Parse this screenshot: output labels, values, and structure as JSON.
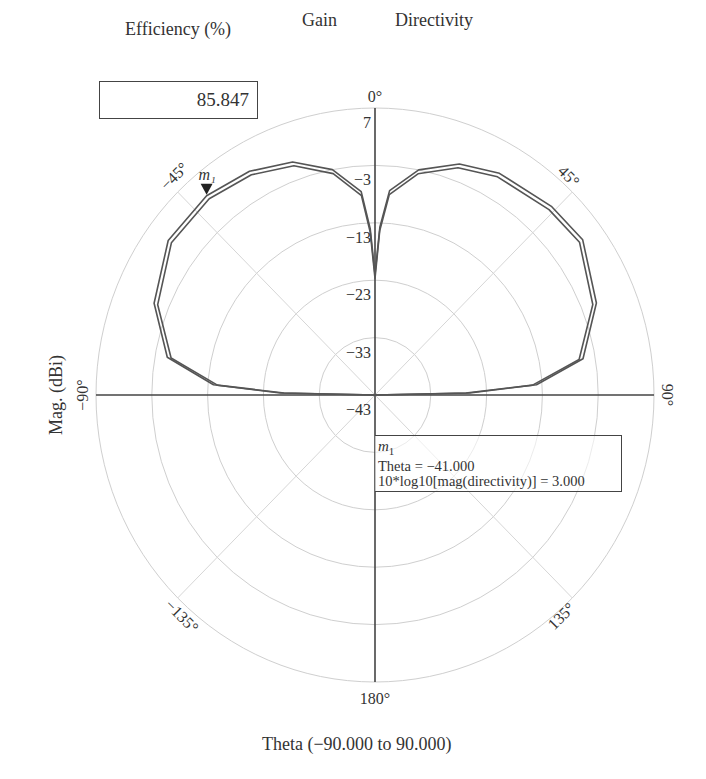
{
  "header": {
    "efficiency_label": "Efficiency (%)",
    "efficiency_value": "85.847",
    "gain_label": "Gain",
    "directivity_label": "Directivity"
  },
  "axes": {
    "ylabel": "Mag. (dBi)",
    "xlabel": "Theta (−90.000 to 90.000)",
    "radial_ticks": [
      "7",
      "−3",
      "−13",
      "−23",
      "−33",
      "−43"
    ],
    "angle_ticks": [
      "0°",
      "45°",
      "90°",
      "135°",
      "180°",
      "−135°",
      "−90°",
      "−45°"
    ]
  },
  "marker": {
    "name": "m",
    "index": "1",
    "line1": "Theta = −41.000",
    "line2": "10*log10[mag(directivity)] = 3.000"
  },
  "colors": {
    "curve": "#555555",
    "grid": "#cfcfcf",
    "axis": "#444444"
  },
  "chart_data": {
    "type": "polar-line",
    "title": "",
    "xlabel": "Theta (−90.000 to 90.000)",
    "ylabel": "Mag. (dBi)",
    "rlim": [
      -43,
      7
    ],
    "r_ticks": [
      7,
      -3,
      -13,
      -23,
      -33,
      -43
    ],
    "theta_ticks_deg": [
      0,
      45,
      90,
      135,
      180,
      -135,
      -90,
      -45
    ],
    "grid": true,
    "legend": [
      "Gain",
      "Directivity"
    ],
    "series": [
      {
        "name": "Directivity",
        "theta_deg": [
          -90,
          -88.8,
          -86.5,
          -80,
          -68,
          -54,
          -41,
          -30,
          -20,
          -11,
          -4,
          -1.7,
          0,
          1.7,
          4.2,
          11.3,
          20.6,
          30,
          44,
          54,
          68,
          80.4,
          86.5,
          88.8,
          90
        ],
        "values_dBi": [
          -43,
          -26,
          -14,
          -5.2,
          -0.3,
          2.8,
          3.0,
          2.0,
          0.2,
          -3,
          -7.5,
          -14,
          -22,
          -13.7,
          -7.3,
          -3,
          0,
          1.6,
          2.6,
          3.0,
          -0.2,
          -5.2,
          -14,
          -26,
          -43
        ]
      },
      {
        "name": "Gain",
        "theta_deg": [
          -90,
          -88.8,
          -86.5,
          -80,
          -68,
          -54,
          -41,
          -30,
          -20,
          -11,
          -4,
          -1.7,
          0,
          1.7,
          4.2,
          11.3,
          20.6,
          30,
          44,
          54,
          68,
          80.4,
          86.5,
          88.8,
          90
        ],
        "values_dBi": [
          -43,
          -26.7,
          -14.7,
          -5.9,
          -1.0,
          2.1,
          2.3,
          1.3,
          -0.5,
          -3.7,
          -8.2,
          -14.7,
          -22.7,
          -14.4,
          -8.0,
          -3.7,
          -0.7,
          0.9,
          1.9,
          2.3,
          -0.9,
          -5.9,
          -14.7,
          -26.7,
          -43
        ]
      }
    ],
    "annotations": [
      {
        "label": "m1",
        "theta_deg": -41.0,
        "value": 3.0,
        "text": "10*log10[mag(directivity)] = 3.000"
      }
    ],
    "efficiency_percent": 85.847
  }
}
